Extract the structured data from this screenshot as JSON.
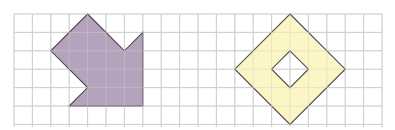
{
  "diagram": {
    "background": "#ffffff",
    "grid": {
      "origin_x": 14,
      "origin_y": 14,
      "cell": 18.4,
      "cols": 20,
      "rows": 6,
      "bottom_y": 127,
      "line_color": "#cfcfcf"
    },
    "shapes": [
      {
        "name": "purple-arrow-shape",
        "fill": "#b5a3bd",
        "stroke": "#4a4a4a",
        "points": [
          [
            4,
            0
          ],
          [
            6,
            2
          ],
          [
            7,
            1
          ],
          [
            7,
            5
          ],
          [
            3,
            5
          ],
          [
            4,
            4
          ],
          [
            2,
            2
          ]
        ]
      },
      {
        "name": "yellow-diamond-ring",
        "fill": "#fbf6c4",
        "stroke": "#4a4a4a",
        "outer": [
          [
            15,
            0
          ],
          [
            18,
            3
          ],
          [
            15,
            6
          ],
          [
            12,
            3
          ]
        ],
        "hole": [
          [
            15,
            2
          ],
          [
            16,
            3
          ],
          [
            15,
            4
          ],
          [
            14,
            3
          ]
        ]
      }
    ],
    "interior_grid_lines_visible": true
  }
}
